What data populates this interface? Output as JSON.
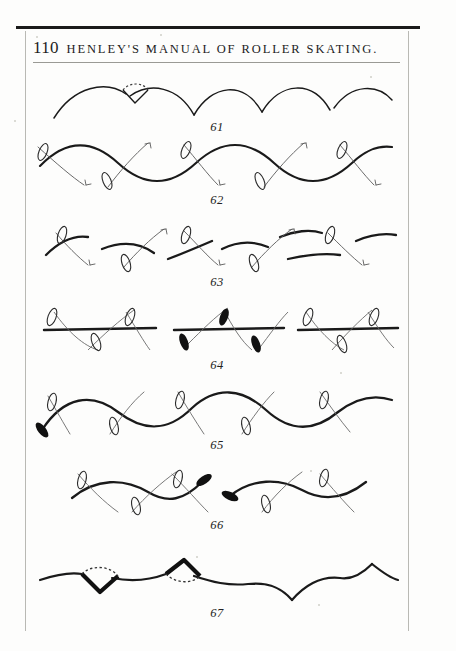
{
  "page": {
    "number": "110",
    "running_head": "HENLEY'S MANUAL OF ROLLER SKATING.",
    "background_color": "#fdfdfc",
    "ink_color": "#1a1a1a"
  },
  "figures": [
    {
      "caption": "61",
      "description": "Series of linked shallow arcs (scallops) with a dashed foot outline at the first apex"
    },
    {
      "caption": "62",
      "description": "Continuous serpentine curve with skate-foot outlines and direction arrows at each crossing"
    },
    {
      "caption": "63",
      "description": "Broken serpentine segments with skate-foot outlines and labelled direction arrows"
    },
    {
      "caption": "64",
      "description": "Three straight-line groups with crossing curves, outlined and solid skate feet"
    },
    {
      "caption": "65",
      "description": "Long serpentine curve beginning at a solid black foot, outlined feet along its length"
    },
    {
      "caption": "66",
      "description": "Two short serpentine curves, each terminating in a solid black foot"
    },
    {
      "caption": "67",
      "description": "Shallow undulating line with two cusp figures closed by dashed arcs"
    }
  ]
}
